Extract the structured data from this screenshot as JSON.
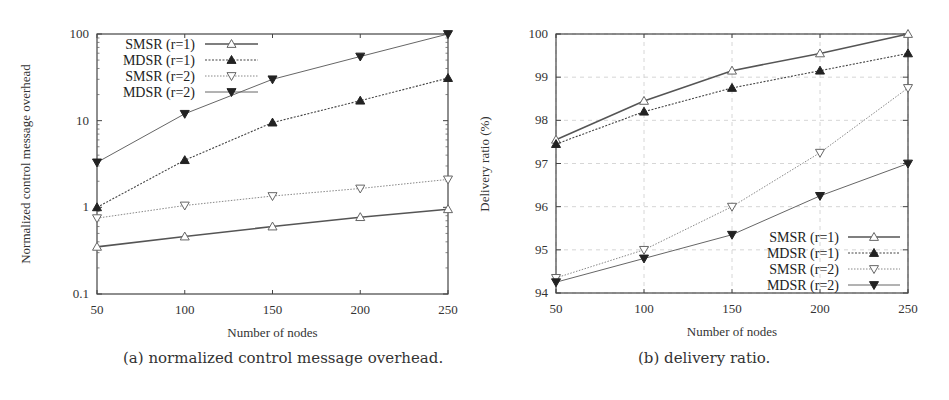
{
  "chart_data": [
    {
      "type": "line",
      "id": "a",
      "caption": "(a) normalized control message overhead.",
      "xlabel": "Number of nodes",
      "ylabel": "Normalized control message overhead",
      "yscale": "log",
      "ylim": [
        0.1,
        100
      ],
      "xlim": [
        50,
        250
      ],
      "x": [
        50,
        100,
        150,
        200,
        250
      ],
      "xticks": [
        "50",
        "100",
        "150",
        "200",
        "250"
      ],
      "yticks": [
        "0.1",
        "1",
        "10",
        "100"
      ],
      "grid": false,
      "legend_position": "upper left",
      "series": [
        {
          "name": "SMSR (r=1)",
          "marker": "triangle-up-open",
          "line": "solid-thick",
          "values": [
            0.35,
            0.46,
            0.6,
            0.77,
            0.95
          ]
        },
        {
          "name": "MDSR (r=1)",
          "marker": "triangle-up-filled",
          "line": "dotted",
          "values": [
            1.0,
            3.5,
            9.5,
            17,
            31
          ]
        },
        {
          "name": "SMSR (r=2)",
          "marker": "triangle-down-open",
          "line": "dotted-light",
          "values": [
            0.75,
            1.05,
            1.35,
            1.65,
            2.1
          ]
        },
        {
          "name": "MDSR (r=2)",
          "marker": "triangle-down-filled",
          "line": "solid-thin",
          "values": [
            3.3,
            12,
            30,
            55,
            100
          ]
        }
      ]
    },
    {
      "type": "line",
      "id": "b",
      "caption": "(b) delivery ratio.",
      "xlabel": "Number of nodes",
      "ylabel": "Delivery ratio (%)",
      "yscale": "linear",
      "ylim": [
        94,
        100
      ],
      "xlim": [
        50,
        250
      ],
      "x": [
        50,
        100,
        150,
        200,
        250
      ],
      "xticks": [
        "50",
        "100",
        "150",
        "200",
        "250"
      ],
      "yticks": [
        "94",
        "95",
        "96",
        "97",
        "98",
        "99",
        "100"
      ],
      "grid": true,
      "legend_position": "lower right",
      "series": [
        {
          "name": "SMSR (r=1)",
          "marker": "triangle-up-open",
          "line": "solid-thick",
          "values": [
            97.55,
            98.45,
            99.15,
            99.55,
            100.0
          ]
        },
        {
          "name": "MDSR (r=1)",
          "marker": "triangle-up-filled",
          "line": "dotted",
          "values": [
            97.45,
            98.2,
            98.75,
            99.15,
            99.55
          ]
        },
        {
          "name": "SMSR (r=2)",
          "marker": "triangle-down-open",
          "line": "dotted-light",
          "values": [
            94.35,
            95.0,
            96.0,
            97.25,
            98.75
          ]
        },
        {
          "name": "MDSR (r=2)",
          "marker": "triangle-down-filled",
          "line": "solid-thin",
          "values": [
            94.25,
            94.8,
            95.35,
            96.25,
            97.0
          ]
        }
      ]
    }
  ]
}
